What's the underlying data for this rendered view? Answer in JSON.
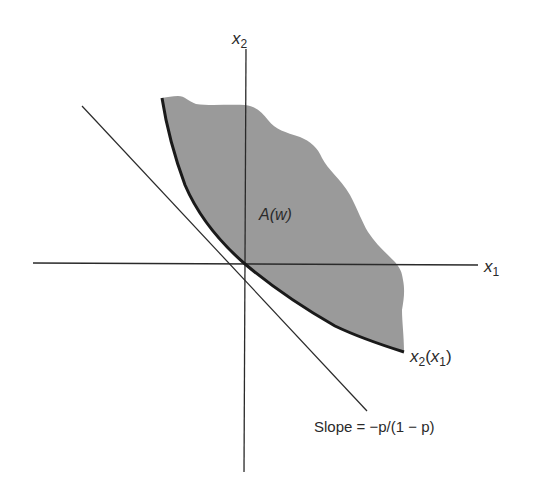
{
  "figure": {
    "axes": {
      "x_label": "x",
      "x_sub": "1",
      "y_label": "x",
      "y_sub": "2"
    },
    "region": {
      "label": "A(w)",
      "fill_color": "#9a9a9a"
    },
    "curve": {
      "label_main": "x",
      "label_sub": "2",
      "label_arg_open": "(",
      "label_arg": "x",
      "label_arg_sub": "1",
      "label_arg_close": ")"
    },
    "tangent": {
      "label": "Slope = −p/(1 − p)"
    },
    "colors": {
      "ink": "#2a2a2a",
      "background": "#ffffff"
    }
  }
}
